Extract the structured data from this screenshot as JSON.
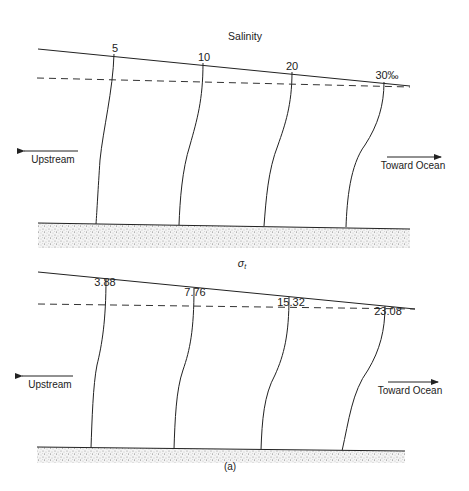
{
  "figure": {
    "caption": "(a)",
    "colors": {
      "ink": "#222222",
      "sediment": "#9a9a9a",
      "background": "#ffffff"
    }
  },
  "panels": [
    {
      "title": "Salinity",
      "isolines": [
        {
          "label": "5"
        },
        {
          "label": "10"
        },
        {
          "label": "20"
        },
        {
          "label": "30‰"
        }
      ],
      "upstream_label": "Upstream",
      "ocean_label": "Toward Ocean"
    },
    {
      "title": "σ",
      "title_subscript": "t",
      "isolines": [
        {
          "label": "3.88"
        },
        {
          "label": "7.76"
        },
        {
          "label": "15.32"
        },
        {
          "label": "23.08"
        }
      ],
      "upstream_label": "Upstream",
      "ocean_label": "Toward Ocean"
    }
  ]
}
